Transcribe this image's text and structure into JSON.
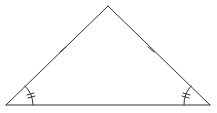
{
  "diagram": {
    "type": "isosceles-triangle",
    "stroke_color": "#333333",
    "background": "#ffffff",
    "vertices": {
      "apex": [
        108,
        6
      ],
      "bottom_left": [
        6,
        105
      ],
      "bottom_right": [
        210,
        105
      ]
    },
    "markings": {
      "equal_sides": [
        "left-side",
        "right-side"
      ],
      "side_tick_count": 1,
      "equal_angles": [
        "bottom-left-angle",
        "bottom-right-angle"
      ],
      "angle_tick_count": 2
    }
  }
}
